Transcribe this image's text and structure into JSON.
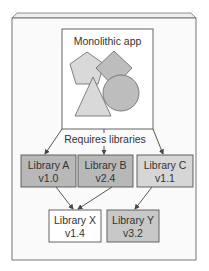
{
  "diagram": {
    "app": {
      "title": "Monolithic app",
      "fill": "#ffffff"
    },
    "connector_label": "Requires libraries",
    "libraries_direct": [
      {
        "name": "Library A",
        "version": "v1.0",
        "fill": "#b8b8b8"
      },
      {
        "name": "Library B",
        "version": "v2.4",
        "fill": "#b8b8b8"
      },
      {
        "name": "Library C",
        "version": "v1.1",
        "fill": "#d6d6d6"
      }
    ],
    "libraries_transitive": [
      {
        "name": "Library X",
        "version": "v1.4",
        "fill": "#ffffff"
      },
      {
        "name": "Library Y",
        "version": "v3.2",
        "fill": "#c8c8c8"
      }
    ],
    "shapes": [
      "pentagon",
      "diamond",
      "circle",
      "triangle"
    ],
    "colors": {
      "frame_bg": "#fafafa",
      "stroke": "#555555",
      "shape_light": "#d9d9d9",
      "shape_medium": "#bdbdbd"
    }
  }
}
